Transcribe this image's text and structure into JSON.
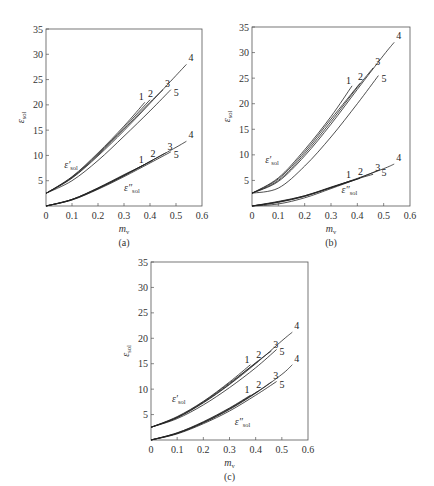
{
  "chart_data": [
    {
      "type": "line",
      "panel": "(a)",
      "caption": "(a)",
      "xlabel": "m_v",
      "ylabel": "ε_sol",
      "xlim": [
        0,
        0.6
      ],
      "ylim": [
        0,
        35
      ],
      "xticks": [
        "0",
        "0.1",
        "0.2",
        "0.3",
        "0.4",
        "0.5",
        "0.6"
      ],
      "yticks": [
        "5",
        "10",
        "15",
        "20",
        "25",
        "30",
        "35"
      ],
      "y_zero_label": "0",
      "grid": false,
      "curve_groups": [
        {
          "name": "ε'_sol",
          "label_pos": [
            0.07,
            7.5
          ],
          "series": [
            {
              "name": "1",
              "x": [
                0,
                0.1,
                0.2,
                0.3,
                0.38
              ],
              "y": [
                2.5,
                5.8,
                10.5,
                15.8,
                20.5
              ]
            },
            {
              "name": "2",
              "x": [
                0,
                0.1,
                0.2,
                0.3,
                0.4
              ],
              "y": [
                2.5,
                5.7,
                10.3,
                15.5,
                21.0
              ]
            },
            {
              "name": "3",
              "x": [
                0,
                0.1,
                0.2,
                0.3,
                0.4,
                0.45
              ],
              "y": [
                2.5,
                5.6,
                10.1,
                15.2,
                20.5,
                23.0
              ]
            },
            {
              "name": "4",
              "x": [
                0,
                0.1,
                0.2,
                0.3,
                0.4,
                0.5,
                0.54
              ],
              "y": [
                2.5,
                5.5,
                9.9,
                14.9,
                20.3,
                25.8,
                28.0
              ]
            },
            {
              "name": "5",
              "x": [
                0,
                0.1,
                0.2,
                0.3,
                0.4,
                0.48
              ],
              "y": [
                2.5,
                5.0,
                9.0,
                13.8,
                18.8,
                23.0
              ]
            }
          ]
        },
        {
          "name": "ε''_sol",
          "label_pos": [
            0.3,
            3.0
          ],
          "series": [
            {
              "name": "1",
              "x": [
                0,
                0.1,
                0.2,
                0.3,
                0.38
              ],
              "y": [
                0,
                1.3,
                3.6,
                6.2,
                8.2
              ]
            },
            {
              "name": "2",
              "x": [
                0,
                0.1,
                0.2,
                0.3,
                0.41
              ],
              "y": [
                0,
                1.3,
                3.5,
                6.1,
                9.0
              ]
            },
            {
              "name": "3",
              "x": [
                0,
                0.1,
                0.2,
                0.3,
                0.4,
                0.46
              ],
              "y": [
                0,
                1.3,
                3.5,
                6.0,
                8.8,
                10.5
              ]
            },
            {
              "name": "4",
              "x": [
                0,
                0.1,
                0.2,
                0.3,
                0.4,
                0.5,
                0.54
              ],
              "y": [
                0,
                1.2,
                3.4,
                6.0,
                8.8,
                11.6,
                12.8
              ]
            },
            {
              "name": "5",
              "x": [
                0,
                0.1,
                0.2,
                0.3,
                0.4,
                0.48
              ],
              "y": [
                0,
                1.2,
                3.3,
                5.8,
                8.5,
                10.7
              ]
            }
          ]
        }
      ]
    },
    {
      "type": "line",
      "panel": "(b)",
      "caption": "(b)",
      "xlabel": "m_v",
      "ylabel": "ε_sol",
      "xlim": [
        0,
        0.6
      ],
      "ylim": [
        0,
        35
      ],
      "xticks": [
        "0",
        "0.1",
        "0.2",
        "0.3",
        "0.4",
        "0.5",
        "0.6"
      ],
      "yticks": [
        "5",
        "10",
        "15",
        "20",
        "25",
        "30",
        "35"
      ],
      "y_zero_label": "0",
      "grid": false,
      "curve_groups": [
        {
          "name": "ε'_sol",
          "label_pos": [
            0.05,
            8.5
          ],
          "series": [
            {
              "name": "1",
              "x": [
                0,
                0.1,
                0.2,
                0.3,
                0.38
              ],
              "y": [
                2.5,
                5.5,
                11.0,
                17.5,
                23.5
              ]
            },
            {
              "name": "2",
              "x": [
                0,
                0.1,
                0.2,
                0.3,
                0.41
              ],
              "y": [
                2.5,
                5.3,
                10.6,
                17.0,
                24.0
              ]
            },
            {
              "name": "3",
              "x": [
                0,
                0.1,
                0.2,
                0.3,
                0.4,
                0.46
              ],
              "y": [
                2.5,
                5.0,
                10.2,
                16.5,
                23.2,
                27.0
              ]
            },
            {
              "name": "4",
              "x": [
                0,
                0.1,
                0.2,
                0.3,
                0.4,
                0.5,
                0.54
              ],
              "y": [
                2.5,
                4.8,
                9.8,
                16.0,
                22.8,
                29.5,
                32.0
              ]
            },
            {
              "name": "5",
              "x": [
                0,
                0.1,
                0.2,
                0.3,
                0.4,
                0.48
              ],
              "y": [
                2.5,
                3.5,
                7.8,
                13.5,
                20.0,
                25.5
              ]
            }
          ]
        },
        {
          "name": "ε''_sol",
          "label_pos": [
            0.34,
            2.5
          ],
          "series": [
            {
              "name": "1",
              "x": [
                0,
                0.1,
                0.2,
                0.3,
                0.38
              ],
              "y": [
                0,
                0.9,
                2.0,
                3.7,
                5.0
              ]
            },
            {
              "name": "2",
              "x": [
                0,
                0.1,
                0.2,
                0.3,
                0.41
              ],
              "y": [
                0,
                0.8,
                2.0,
                3.6,
                5.4
              ]
            },
            {
              "name": "3",
              "x": [
                0,
                0.1,
                0.2,
                0.3,
                0.4,
                0.46
              ],
              "y": [
                0,
                0.8,
                1.9,
                3.6,
                5.3,
                6.2
              ]
            },
            {
              "name": "4",
              "x": [
                0,
                0.1,
                0.2,
                0.3,
                0.4,
                0.5,
                0.54
              ],
              "y": [
                0,
                0.7,
                1.9,
                3.6,
                5.4,
                7.3,
                8.2
              ]
            },
            {
              "name": "5",
              "x": [
                0,
                0.1,
                0.2,
                0.3,
                0.4,
                0.48
              ],
              "y": [
                0,
                0.4,
                1.6,
                3.4,
                5.3,
                7.0
              ]
            }
          ]
        }
      ]
    },
    {
      "type": "line",
      "panel": "(c)",
      "caption": "(c)",
      "xlabel": "m_v",
      "ylabel": "ε_sol",
      "xlim": [
        0,
        0.6
      ],
      "ylim": [
        0,
        35
      ],
      "xticks": [
        "0",
        "0.1",
        "0.2",
        "0.3",
        "0.4",
        "0.5",
        "0.6"
      ],
      "yticks": [
        "5",
        "10",
        "15",
        "20",
        "25",
        "30",
        "35"
      ],
      "y_zero_label": "0",
      "grid": false,
      "curve_groups": [
        {
          "name": "ε'_sol",
          "label_pos": [
            0.08,
            7.5
          ],
          "series": [
            {
              "name": "1",
              "x": [
                0,
                0.1,
                0.2,
                0.3,
                0.38
              ],
              "y": [
                2.5,
                4.6,
                7.6,
                11.4,
                14.8
              ]
            },
            {
              "name": "2",
              "x": [
                0,
                0.1,
                0.2,
                0.3,
                0.41
              ],
              "y": [
                2.5,
                4.5,
                7.5,
                11.2,
                15.5
              ]
            },
            {
              "name": "3",
              "x": [
                0,
                0.1,
                0.2,
                0.3,
                0.4,
                0.46
              ],
              "y": [
                2.5,
                4.4,
                7.4,
                11.0,
                15.2,
                17.5
              ]
            },
            {
              "name": "4",
              "x": [
                0,
                0.1,
                0.2,
                0.3,
                0.4,
                0.5,
                0.54
              ],
              "y": [
                2.5,
                4.4,
                7.3,
                10.9,
                15.0,
                19.5,
                21.2
              ]
            },
            {
              "name": "5",
              "x": [
                0,
                0.1,
                0.2,
                0.3,
                0.4,
                0.48
              ],
              "y": [
                2.5,
                4.2,
                6.9,
                10.3,
                14.2,
                17.8
              ]
            }
          ]
        },
        {
          "name": "ε''_sol",
          "label_pos": [
            0.32,
            3.0
          ],
          "series": [
            {
              "name": "1",
              "x": [
                0,
                0.1,
                0.2,
                0.3,
                0.38
              ],
              "y": [
                0,
                1.4,
                3.6,
                6.3,
                8.8
              ]
            },
            {
              "name": "2",
              "x": [
                0,
                0.1,
                0.2,
                0.3,
                0.41
              ],
              "y": [
                0,
                1.4,
                3.5,
                6.2,
                9.6
              ]
            },
            {
              "name": "3",
              "x": [
                0,
                0.1,
                0.2,
                0.3,
                0.4,
                0.46
              ],
              "y": [
                0,
                1.3,
                3.4,
                6.1,
                9.3,
                11.4
              ]
            },
            {
              "name": "4",
              "x": [
                0,
                0.1,
                0.2,
                0.3,
                0.4,
                0.5,
                0.54
              ],
              "y": [
                0,
                1.3,
                3.4,
                6.0,
                9.2,
                12.9,
                14.8
              ]
            },
            {
              "name": "5",
              "x": [
                0,
                0.1,
                0.2,
                0.3,
                0.4,
                0.48
              ],
              "y": [
                0,
                1.2,
                3.2,
                5.7,
                8.8,
                11.5
              ]
            }
          ]
        }
      ]
    }
  ]
}
